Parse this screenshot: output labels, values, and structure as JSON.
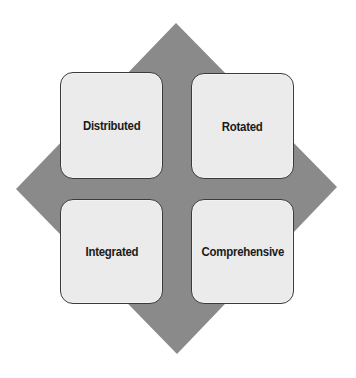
{
  "diagram": {
    "type": "quadrant-diamond",
    "colors": {
      "diamond": "#8a8a8a",
      "box_fill": "#ebebeb",
      "box_border": "#3a3a3a",
      "text": "#1a1a1a"
    },
    "quadrants": [
      {
        "position": "top-left",
        "label": "Distributed"
      },
      {
        "position": "top-right",
        "label": "Rotated"
      },
      {
        "position": "bottom-left",
        "label": "Integrated"
      },
      {
        "position": "bottom-right",
        "label": "Comprehensive"
      }
    ]
  }
}
